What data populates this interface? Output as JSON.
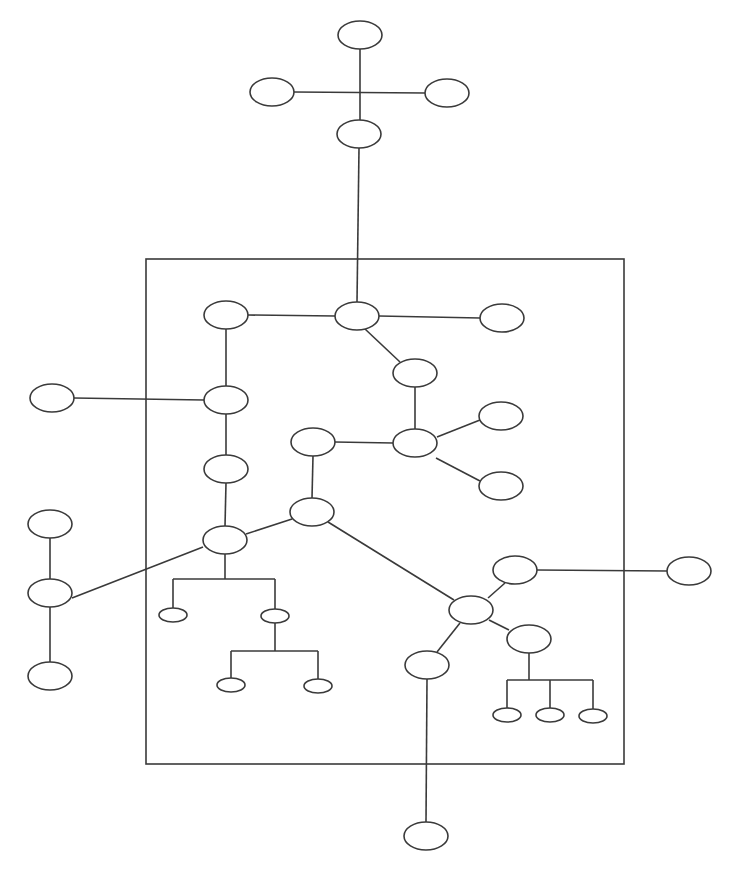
{
  "diagram": {
    "type": "tree-network",
    "stroke_color": "#3a3a3a",
    "background": "#ffffff",
    "frame": {
      "x1": 146,
      "y1": 259,
      "x2": 624,
      "y2": 764
    },
    "nodes": [
      {
        "id": "n1",
        "cx": 360,
        "cy": 35,
        "rx": 22,
        "ry": 14
      },
      {
        "id": "n2",
        "cx": 272,
        "cy": 92,
        "rx": 22,
        "ry": 14
      },
      {
        "id": "n3",
        "cx": 447,
        "cy": 93,
        "rx": 22,
        "ry": 14
      },
      {
        "id": "n4",
        "cx": 359,
        "cy": 134,
        "rx": 22,
        "ry": 14
      },
      {
        "id": "n5",
        "cx": 226,
        "cy": 315,
        "rx": 22,
        "ry": 14
      },
      {
        "id": "n6",
        "cx": 357,
        "cy": 316,
        "rx": 22,
        "ry": 14
      },
      {
        "id": "n7",
        "cx": 502,
        "cy": 318,
        "rx": 22,
        "ry": 14
      },
      {
        "id": "n8",
        "cx": 415,
        "cy": 373,
        "rx": 22,
        "ry": 14
      },
      {
        "id": "n9",
        "cx": 52,
        "cy": 398,
        "rx": 22,
        "ry": 14
      },
      {
        "id": "n10",
        "cx": 226,
        "cy": 400,
        "rx": 22,
        "ry": 14
      },
      {
        "id": "n11",
        "cx": 501,
        "cy": 416,
        "rx": 22,
        "ry": 14
      },
      {
        "id": "n12",
        "cx": 313,
        "cy": 442,
        "rx": 22,
        "ry": 14
      },
      {
        "id": "n13",
        "cx": 415,
        "cy": 443,
        "rx": 22,
        "ry": 14
      },
      {
        "id": "n14",
        "cx": 226,
        "cy": 469,
        "rx": 22,
        "ry": 14
      },
      {
        "id": "n15",
        "cx": 501,
        "cy": 486,
        "rx": 22,
        "ry": 14
      },
      {
        "id": "n16",
        "cx": 312,
        "cy": 512,
        "rx": 22,
        "ry": 14
      },
      {
        "id": "n17",
        "cx": 50,
        "cy": 524,
        "rx": 22,
        "ry": 14
      },
      {
        "id": "n18",
        "cx": 225,
        "cy": 540,
        "rx": 22,
        "ry": 14
      },
      {
        "id": "n19",
        "cx": 515,
        "cy": 570,
        "rx": 22,
        "ry": 14
      },
      {
        "id": "n20",
        "cx": 689,
        "cy": 571,
        "rx": 22,
        "ry": 14
      },
      {
        "id": "n21",
        "cx": 50,
        "cy": 593,
        "rx": 22,
        "ry": 14
      },
      {
        "id": "n22",
        "cx": 471,
        "cy": 610,
        "rx": 22,
        "ry": 14
      },
      {
        "id": "n23",
        "cx": 173,
        "cy": 615,
        "rx": 14,
        "ry": 7
      },
      {
        "id": "n24",
        "cx": 275,
        "cy": 616,
        "rx": 14,
        "ry": 7
      },
      {
        "id": "n25",
        "cx": 529,
        "cy": 639,
        "rx": 22,
        "ry": 14
      },
      {
        "id": "n26",
        "cx": 427,
        "cy": 665,
        "rx": 22,
        "ry": 14
      },
      {
        "id": "n27",
        "cx": 50,
        "cy": 676,
        "rx": 22,
        "ry": 14
      },
      {
        "id": "n28",
        "cx": 231,
        "cy": 685,
        "rx": 14,
        "ry": 7
      },
      {
        "id": "n29",
        "cx": 318,
        "cy": 686,
        "rx": 14,
        "ry": 7
      },
      {
        "id": "n30",
        "cx": 507,
        "cy": 715,
        "rx": 14,
        "ry": 7
      },
      {
        "id": "n31",
        "cx": 550,
        "cy": 715,
        "rx": 14,
        "ry": 7
      },
      {
        "id": "n32",
        "cx": 593,
        "cy": 716,
        "rx": 14,
        "ry": 7
      },
      {
        "id": "n33",
        "cx": 426,
        "cy": 836,
        "rx": 22,
        "ry": 14
      }
    ],
    "edges": [
      {
        "x1": 360,
        "y1": 49,
        "x2": 360,
        "y2": 120
      },
      {
        "x1": 294,
        "y1": 92,
        "x2": 425,
        "y2": 93
      },
      {
        "x1": 359,
        "y1": 148,
        "x2": 357,
        "y2": 302
      },
      {
        "x1": 248,
        "y1": 315,
        "x2": 335,
        "y2": 316
      },
      {
        "x1": 379,
        "y1": 316,
        "x2": 480,
        "y2": 318
      },
      {
        "x1": 365,
        "y1": 329,
        "x2": 400,
        "y2": 362
      },
      {
        "x1": 415,
        "y1": 387,
        "x2": 415,
        "y2": 429
      },
      {
        "x1": 226,
        "y1": 329,
        "x2": 226,
        "y2": 386
      },
      {
        "x1": 74,
        "y1": 398,
        "x2": 204,
        "y2": 400
      },
      {
        "x1": 437,
        "y1": 437,
        "x2": 480,
        "y2": 420
      },
      {
        "x1": 436,
        "y1": 458,
        "x2": 480,
        "y2": 481
      },
      {
        "x1": 335,
        "y1": 442,
        "x2": 393,
        "y2": 443
      },
      {
        "x1": 313,
        "y1": 456,
        "x2": 312,
        "y2": 498
      },
      {
        "x1": 226,
        "y1": 414,
        "x2": 226,
        "y2": 455
      },
      {
        "x1": 226,
        "y1": 483,
        "x2": 225,
        "y2": 526
      },
      {
        "x1": 246,
        "y1": 534,
        "x2": 292,
        "y2": 519
      },
      {
        "x1": 328,
        "y1": 522,
        "x2": 454,
        "y2": 600
      },
      {
        "x1": 72,
        "y1": 598,
        "x2": 203,
        "y2": 547
      },
      {
        "x1": 50,
        "y1": 538,
        "x2": 50,
        "y2": 579
      },
      {
        "x1": 50,
        "y1": 607,
        "x2": 50,
        "y2": 662
      },
      {
        "x1": 225,
        "y1": 554,
        "x2": 225,
        "y2": 579
      },
      {
        "x1": 173,
        "y1": 579,
        "x2": 275,
        "y2": 579
      },
      {
        "x1": 173,
        "y1": 579,
        "x2": 173,
        "y2": 608
      },
      {
        "x1": 275,
        "y1": 579,
        "x2": 275,
        "y2": 609
      },
      {
        "x1": 275,
        "y1": 623,
        "x2": 275,
        "y2": 651
      },
      {
        "x1": 231,
        "y1": 651,
        "x2": 318,
        "y2": 651
      },
      {
        "x1": 231,
        "y1": 651,
        "x2": 231,
        "y2": 678
      },
      {
        "x1": 318,
        "y1": 651,
        "x2": 318,
        "y2": 679
      },
      {
        "x1": 537,
        "y1": 570,
        "x2": 667,
        "y2": 571
      },
      {
        "x1": 505,
        "y1": 583,
        "x2": 488,
        "y2": 598
      },
      {
        "x1": 489,
        "y1": 620,
        "x2": 509,
        "y2": 630
      },
      {
        "x1": 460,
        "y1": 623,
        "x2": 437,
        "y2": 652
      },
      {
        "x1": 529,
        "y1": 653,
        "x2": 529,
        "y2": 680
      },
      {
        "x1": 507,
        "y1": 680,
        "x2": 593,
        "y2": 680
      },
      {
        "x1": 507,
        "y1": 680,
        "x2": 507,
        "y2": 708
      },
      {
        "x1": 550,
        "y1": 680,
        "x2": 550,
        "y2": 708
      },
      {
        "x1": 593,
        "y1": 680,
        "x2": 593,
        "y2": 709
      },
      {
        "x1": 427,
        "y1": 679,
        "x2": 426,
        "y2": 822
      }
    ]
  }
}
